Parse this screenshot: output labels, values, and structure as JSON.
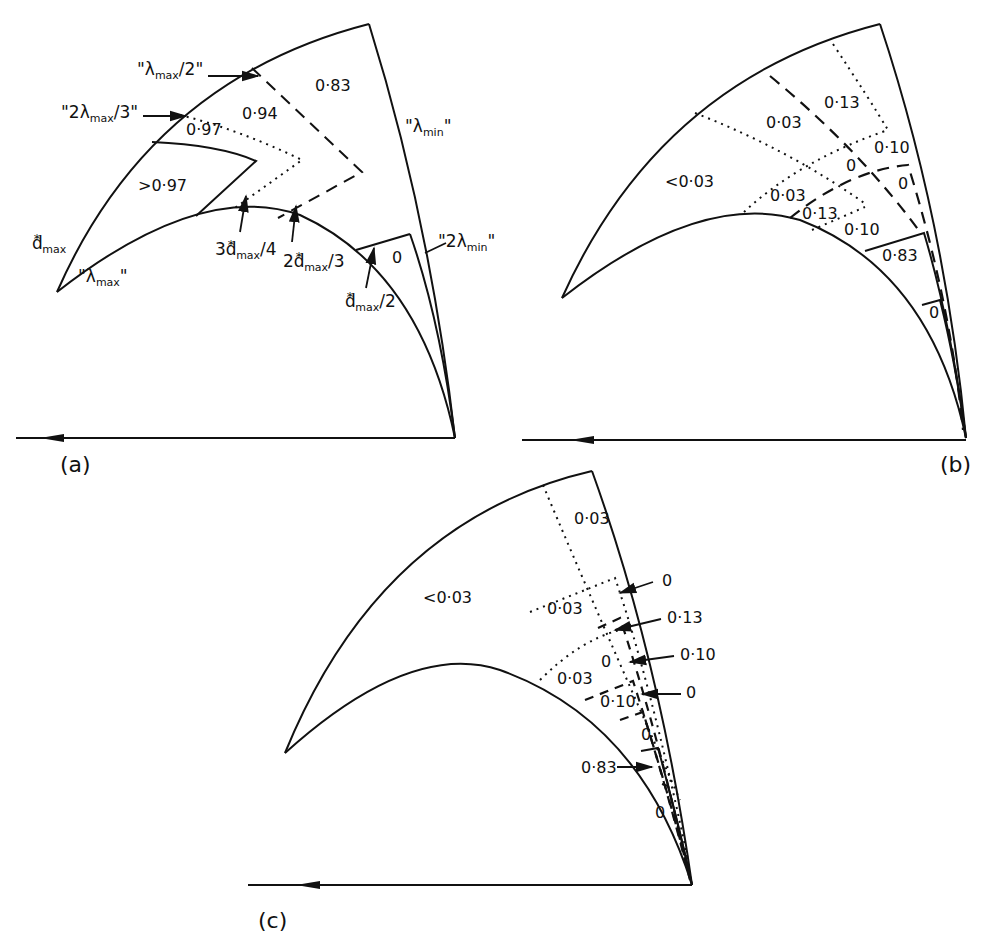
{
  "figure": {
    "panels": [
      {
        "id": "a",
        "tag": "(a)",
        "region_values": [
          {
            "text": ">0·97",
            "x": 138,
            "y": 178
          },
          {
            "text": "0·97",
            "x": 186,
            "y": 122
          },
          {
            "text": "0·94",
            "x": 242,
            "y": 106
          },
          {
            "text": "0·83",
            "x": 315,
            "y": 78
          },
          {
            "text": "0",
            "x": 392,
            "y": 250
          }
        ],
        "boundary_labels": {
          "lambda_max_half": {
            "quote": "\"",
            "sym": "λ",
            "sub": "max",
            "tail": "/2\""
          },
          "two_lambda_max_third": {
            "quote": "\"2",
            "sym": "λ",
            "sub": "max",
            "tail": "/3\""
          },
          "lambda_min": {
            "quote": "\"",
            "sym": "λ",
            "sub": "min",
            "tail": "\""
          },
          "two_lambda_min": {
            "quote": "\"2",
            "sym": "λ",
            "sub": "min",
            "tail": "\""
          },
          "lambda_max": {
            "quote": "\"",
            "sym": "λ",
            "sub": "max",
            "tail": "\""
          },
          "d_max": {
            "sym": "d",
            "sup": "*",
            "sub": "max",
            "tail": ""
          },
          "three_d_max_quarter": {
            "pre": "3",
            "sym": "d",
            "sup": "*",
            "sub": "max",
            "tail": "/4"
          },
          "two_d_max_third": {
            "pre": "2",
            "sym": "d",
            "sup": "*",
            "sub": "max",
            "tail": "/3"
          },
          "d_max_half": {
            "pre": "",
            "sym": "d",
            "sup": "*",
            "sub": "max",
            "tail": "/2"
          }
        }
      },
      {
        "id": "b",
        "tag": "(b)",
        "region_values": [
          {
            "text": "<0·03",
            "x": 665,
            "y": 174
          },
          {
            "text": "0·03",
            "x": 766,
            "y": 115
          },
          {
            "text": "0·13",
            "x": 824,
            "y": 95
          },
          {
            "text": "0·10",
            "x": 874,
            "y": 140
          },
          {
            "text": "0",
            "x": 846,
            "y": 158
          },
          {
            "text": "0",
            "x": 898,
            "y": 176
          },
          {
            "text": "0·03",
            "x": 770,
            "y": 188
          },
          {
            "text": "0·13",
            "x": 802,
            "y": 206
          },
          {
            "text": "0·10",
            "x": 844,
            "y": 222
          },
          {
            "text": "0·83",
            "x": 882,
            "y": 248
          },
          {
            "text": "0",
            "x": 929,
            "y": 305
          }
        ]
      },
      {
        "id": "c",
        "tag": "(c)",
        "region_values": [
          {
            "text": "<0·03",
            "x": 423,
            "y": 590
          },
          {
            "text": "0·03",
            "x": 574,
            "y": 511
          },
          {
            "text": "0·03",
            "x": 547,
            "y": 601
          },
          {
            "text": "0·03",
            "x": 557,
            "y": 671
          },
          {
            "text": "0",
            "x": 601,
            "y": 654
          },
          {
            "text": "0·10",
            "x": 600,
            "y": 694
          },
          {
            "text": "0",
            "x": 641,
            "y": 727
          },
          {
            "text": "0",
            "x": 655,
            "y": 805
          }
        ],
        "callouts": [
          {
            "text": "0",
            "x": 662,
            "y": 573
          },
          {
            "text": "0·13",
            "x": 667,
            "y": 610
          },
          {
            "text": "0·10",
            "x": 680,
            "y": 647
          },
          {
            "text": "0",
            "x": 686,
            "y": 685
          },
          {
            "text": "0·83",
            "x": 581,
            "y": 760
          }
        ]
      }
    ]
  }
}
